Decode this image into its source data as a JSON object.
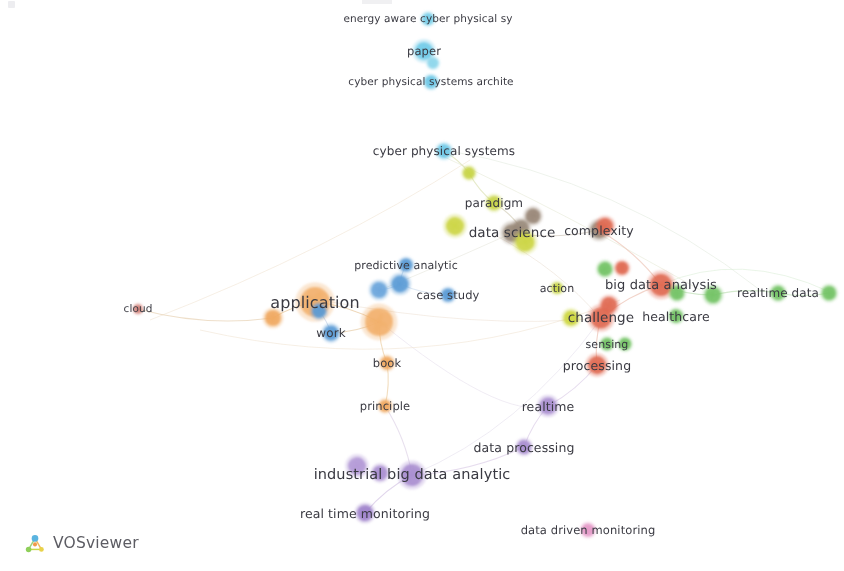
{
  "app": {
    "name": "VOSviewer",
    "logo_text": "VOSviewer",
    "logo_icon": "vosviewer-network-logo",
    "background_color": "#ffffff",
    "label_color": "#3a3a42",
    "canvas_width": 844,
    "canvas_height": 571
  },
  "chart_data": {
    "type": "scatter",
    "title": "",
    "subtitle": "",
    "xlabel": "",
    "ylabel": "",
    "grid": false,
    "legend_position": "none",
    "clusters": [
      {
        "id": 1,
        "name": "cyber-physical-systems",
        "color": "#6fc9e8"
      },
      {
        "id": 2,
        "name": "analytics-methods",
        "color": "#5b9bd5"
      },
      {
        "id": 3,
        "name": "application-work",
        "color": "#f0a860"
      },
      {
        "id": 4,
        "name": "data-science",
        "color": "#cdd63f"
      },
      {
        "id": 5,
        "name": "paradigm-complexity",
        "color": "#9c8878"
      },
      {
        "id": 6,
        "name": "big-data-challenge",
        "color": "#e06a52"
      },
      {
        "id": 7,
        "name": "healthcare-realtime",
        "color": "#74c365"
      },
      {
        "id": 8,
        "name": "industrial-monitoring",
        "color": "#a98fd0"
      },
      {
        "id": 9,
        "name": "data-driven-monitoring",
        "color": "#e59ac8"
      }
    ],
    "nodes": [
      {
        "label": "energy aware cyber physical sy",
        "x": 428,
        "y": 19,
        "r": 6,
        "color": "#79cfe9",
        "font": 10.5,
        "label_dx": 0,
        "label_dy": 0,
        "show_label": true
      },
      {
        "label": "paper",
        "x": 424,
        "y": 51,
        "r": 9,
        "color": "#72cbe8",
        "font": 11.5,
        "label_dx": 0,
        "label_dy": 0,
        "show_label": true
      },
      {
        "label": "",
        "x": 433,
        "y": 63,
        "r": 5.5,
        "color": "#8ed6ec",
        "font": 10,
        "label_dx": 0,
        "label_dy": 0,
        "show_label": false
      },
      {
        "label": "cyber physical systems archite",
        "x": 431,
        "y": 82,
        "r": 6.5,
        "color": "#6ec8e6",
        "font": 10.5,
        "label_dx": 0,
        "label_dy": 0,
        "show_label": true
      },
      {
        "label": "cyber physical systems",
        "x": 444,
        "y": 151,
        "r": 7,
        "color": "#6ec8e6",
        "font": 12,
        "label_dx": 0,
        "label_dy": 0,
        "show_label": true
      },
      {
        "label": "",
        "x": 469,
        "y": 173,
        "r": 6,
        "color": "#c8d448",
        "font": 10,
        "label_dx": 0,
        "label_dy": 0,
        "show_label": false
      },
      {
        "label": "paradigm",
        "x": 494,
        "y": 203,
        "r": 7,
        "color": "#c8d448",
        "font": 12,
        "label_dx": 0,
        "label_dy": 0,
        "show_label": true
      },
      {
        "label": "",
        "x": 533,
        "y": 216,
        "r": 7.5,
        "color": "#9a8878",
        "font": 10,
        "label_dx": 0,
        "label_dy": 0,
        "show_label": false
      },
      {
        "label": "",
        "x": 521,
        "y": 228,
        "r": 8,
        "color": "#9a8a7a",
        "font": 10,
        "label_dx": 0,
        "label_dy": 0,
        "show_label": false
      },
      {
        "label": "data science",
        "x": 512,
        "y": 233,
        "r": 9,
        "color": "#9a8a7a",
        "font": 13.5,
        "label_dx": 0,
        "label_dy": 0,
        "show_label": true
      },
      {
        "label": "",
        "x": 455,
        "y": 226,
        "r": 9,
        "color": "#ccd545",
        "font": 10,
        "label_dx": 0,
        "label_dy": 0,
        "show_label": false
      },
      {
        "label": "",
        "x": 525,
        "y": 242,
        "r": 9.5,
        "color": "#ccd545",
        "font": 10,
        "label_dx": 0,
        "label_dy": 0,
        "show_label": false
      },
      {
        "label": "complexity",
        "x": 599,
        "y": 230,
        "r": 8.5,
        "color": "#9a8a7a",
        "font": 12.5,
        "label_dx": 0,
        "label_dy": 0,
        "show_label": true
      },
      {
        "label": "",
        "x": 605,
        "y": 226,
        "r": 8,
        "color": "#e06a52",
        "font": 10,
        "label_dx": 0,
        "label_dy": 0,
        "show_label": false
      },
      {
        "label": "predictive analytic",
        "x": 406,
        "y": 265,
        "r": 6.5,
        "color": "#5b9bd5",
        "font": 11,
        "label_dx": 0,
        "label_dy": 0,
        "show_label": true
      },
      {
        "label": "",
        "x": 379,
        "y": 290,
        "r": 8,
        "color": "#6aa5db",
        "font": 10,
        "label_dx": 0,
        "label_dy": 0,
        "show_label": false
      },
      {
        "label": "",
        "x": 400,
        "y": 284,
        "r": 8.5,
        "color": "#5b9bd5",
        "font": 10,
        "label_dx": 0,
        "label_dy": 0,
        "show_label": false
      },
      {
        "label": "case study",
        "x": 448,
        "y": 295,
        "r": 6.5,
        "color": "#5b9bd5",
        "font": 11.5,
        "label_dx": 0,
        "label_dy": 0,
        "show_label": true
      },
      {
        "label": "application",
        "x": 315,
        "y": 302,
        "r": 15,
        "color": "#f2b06b",
        "font": 16,
        "label_dx": 0,
        "label_dy": 0,
        "show_label": true
      },
      {
        "label": "cloud",
        "x": 138,
        "y": 309,
        "r": 4.5,
        "color": "#d4867e",
        "font": 10.5,
        "label_dx": 0,
        "label_dy": 0,
        "show_label": true
      },
      {
        "label": "",
        "x": 273,
        "y": 318,
        "r": 8,
        "color": "#f0a860",
        "font": 10,
        "label_dx": 0,
        "label_dy": 0,
        "show_label": false
      },
      {
        "label": "",
        "x": 319,
        "y": 311,
        "r": 7,
        "color": "#5b9bd5",
        "font": 10,
        "label_dx": 0,
        "label_dy": 0,
        "show_label": false
      },
      {
        "label": "work",
        "x": 331,
        "y": 333,
        "r": 7.5,
        "color": "#5b9bd5",
        "font": 12,
        "label_dx": 0,
        "label_dy": 0,
        "show_label": true
      },
      {
        "label": "",
        "x": 379,
        "y": 322,
        "r": 14,
        "color": "#f2b06b",
        "font": 10,
        "label_dx": 0,
        "label_dy": 0,
        "show_label": false
      },
      {
        "label": "book",
        "x": 387,
        "y": 363,
        "r": 6.5,
        "color": "#f0a860",
        "font": 11.5,
        "label_dx": 0,
        "label_dy": 0,
        "show_label": true
      },
      {
        "label": "principle",
        "x": 385,
        "y": 406,
        "r": 6,
        "color": "#f0a860",
        "font": 11.5,
        "label_dx": 0,
        "label_dy": 0,
        "show_label": true
      },
      {
        "label": "action",
        "x": 557,
        "y": 288,
        "r": 5.5,
        "color": "#c8d448",
        "font": 11,
        "label_dx": 0,
        "label_dy": 0,
        "show_label": true
      },
      {
        "label": "",
        "x": 605,
        "y": 269,
        "r": 7,
        "color": "#74c365",
        "font": 10,
        "label_dx": 0,
        "label_dy": 0,
        "show_label": false
      },
      {
        "label": "",
        "x": 622,
        "y": 268,
        "r": 6.5,
        "color": "#e06a52",
        "font": 10,
        "label_dx": 0,
        "label_dy": 0,
        "show_label": false
      },
      {
        "label": "big data analysis",
        "x": 661,
        "y": 285,
        "r": 11,
        "color": "#e06a52",
        "font": 13,
        "label_dx": 0,
        "label_dy": 0,
        "show_label": true
      },
      {
        "label": "",
        "x": 677,
        "y": 293,
        "r": 7,
        "color": "#74c365",
        "font": 10,
        "label_dx": 0,
        "label_dy": 0,
        "show_label": false
      },
      {
        "label": "",
        "x": 713,
        "y": 295,
        "r": 8,
        "color": "#74c365",
        "font": 10,
        "label_dx": 0,
        "label_dy": 0,
        "show_label": false
      },
      {
        "label": "realtime data",
        "x": 778,
        "y": 293,
        "r": 7,
        "color": "#74c365",
        "font": 12,
        "label_dx": 0,
        "label_dy": 0,
        "show_label": true
      },
      {
        "label": "",
        "x": 829,
        "y": 293,
        "r": 7,
        "color": "#74c365",
        "font": 10,
        "label_dx": 0,
        "label_dy": 0,
        "show_label": false
      },
      {
        "label": "",
        "x": 609,
        "y": 305,
        "r": 8,
        "color": "#e06a52",
        "font": 10,
        "label_dx": 0,
        "label_dy": 0,
        "show_label": false
      },
      {
        "label": "challenge",
        "x": 601,
        "y": 318,
        "r": 10.5,
        "color": "#e06a52",
        "font": 13.5,
        "label_dx": 0,
        "label_dy": 0,
        "show_label": true
      },
      {
        "label": "",
        "x": 571,
        "y": 318,
        "r": 7.5,
        "color": "#cdd63f",
        "font": 10,
        "label_dx": 0,
        "label_dy": 0,
        "show_label": false
      },
      {
        "label": "healthcare",
        "x": 676,
        "y": 316,
        "r": 6.5,
        "color": "#74c365",
        "font": 12.5,
        "label_dx": 0,
        "label_dy": 0,
        "show_label": true
      },
      {
        "label": "sensing",
        "x": 607,
        "y": 344,
        "r": 6,
        "color": "#74c365",
        "font": 11,
        "label_dx": 0,
        "label_dy": 0,
        "show_label": true
      },
      {
        "label": "",
        "x": 625,
        "y": 344,
        "r": 6,
        "color": "#74c365",
        "font": 10,
        "label_dx": 0,
        "label_dy": 0,
        "show_label": false
      },
      {
        "label": "processing",
        "x": 597,
        "y": 365,
        "r": 9,
        "color": "#e06a52",
        "font": 12.5,
        "label_dx": 0,
        "label_dy": 0,
        "show_label": true
      },
      {
        "label": "realtime",
        "x": 548,
        "y": 406,
        "r": 8.5,
        "color": "#a98fd0",
        "font": 12.5,
        "label_dx": 0,
        "label_dy": 0,
        "show_label": true
      },
      {
        "label": "data processing",
        "x": 524,
        "y": 447,
        "r": 7,
        "color": "#a98fd0",
        "font": 12.5,
        "label_dx": 0,
        "label_dy": 0,
        "show_label": true
      },
      {
        "label": "",
        "x": 357,
        "y": 466,
        "r": 9,
        "color": "#b39ad6",
        "font": 10,
        "label_dx": 0,
        "label_dy": 0,
        "show_label": false
      },
      {
        "label": "",
        "x": 380,
        "y": 473,
        "r": 7.5,
        "color": "#a98fd0",
        "font": 10,
        "label_dx": 0,
        "label_dy": 0,
        "show_label": false
      },
      {
        "label": "industrial big data analytic",
        "x": 412,
        "y": 475,
        "r": 11,
        "color": "#a98fd0",
        "font": 14.5,
        "label_dx": 0,
        "label_dy": 0,
        "show_label": true
      },
      {
        "label": "real time monitoring",
        "x": 365,
        "y": 513,
        "r": 8,
        "color": "#9f83cb",
        "font": 12.5,
        "label_dx": 0,
        "label_dy": 0,
        "show_label": true
      },
      {
        "label": "data driven monitoring",
        "x": 588,
        "y": 530,
        "r": 6.5,
        "color": "#e59ac8",
        "font": 11.5,
        "label_dx": 0,
        "label_dy": 0,
        "show_label": true
      }
    ],
    "edges": [
      {
        "from": 138,
        "fy": 309,
        "to": 273,
        "ty": 318,
        "color": "#e8d4b8"
      },
      {
        "from": 273,
        "fy": 318,
        "to": 315,
        "ty": 302,
        "color": "#e8c9a0"
      },
      {
        "from": 315,
        "fy": 302,
        "to": 319,
        "ty": 311,
        "color": "#dfc8a8"
      },
      {
        "from": 319,
        "fy": 311,
        "to": 331,
        "ty": 333,
        "color": "#c9d6e8"
      },
      {
        "from": 331,
        "fy": 333,
        "to": 379,
        "ty": 322,
        "color": "#e8d0ad"
      },
      {
        "from": 315,
        "fy": 302,
        "to": 379,
        "ty": 322,
        "color": "#e8c9a0"
      },
      {
        "from": 379,
        "fy": 322,
        "to": 387,
        "ty": 363,
        "color": "#eed3ab"
      },
      {
        "from": 387,
        "fy": 363,
        "to": 385,
        "ty": 406,
        "color": "#eed3ab"
      },
      {
        "from": 379,
        "fy": 290,
        "to": 400,
        "ty": 284,
        "color": "#c9dcee"
      },
      {
        "from": 400,
        "fy": 284,
        "to": 406,
        "ty": 265,
        "color": "#c9dcee"
      },
      {
        "from": 400,
        "fy": 284,
        "to": 448,
        "ty": 295,
        "color": "#d4e2f0"
      },
      {
        "from": 444,
        "fy": 151,
        "to": 469,
        "ty": 173,
        "color": "#dde3b8"
      },
      {
        "from": 469,
        "fy": 173,
        "to": 494,
        "ty": 203,
        "color": "#dde3b8"
      },
      {
        "from": 494,
        "fy": 203,
        "to": 521,
        "ty": 228,
        "color": "#d6d2bd"
      },
      {
        "from": 512,
        "fy": 233,
        "to": 599,
        "ty": 230,
        "color": "#d4cbc0"
      },
      {
        "from": 599,
        "fy": 230,
        "to": 661,
        "ty": 285,
        "color": "#edc8bb"
      },
      {
        "from": 661,
        "fy": 285,
        "to": 713,
        "ty": 295,
        "color": "#c6e3bd"
      },
      {
        "from": 713,
        "fy": 295,
        "to": 778,
        "ty": 293,
        "color": "#c6e3bd"
      },
      {
        "from": 778,
        "fy": 293,
        "to": 829,
        "ty": 293,
        "color": "#c6e3bd"
      },
      {
        "from": 601,
        "fy": 318,
        "to": 661,
        "ty": 285,
        "color": "#eec6b8"
      },
      {
        "from": 601,
        "fy": 318,
        "to": 597,
        "ty": 365,
        "color": "#eec6b8"
      },
      {
        "from": 597,
        "fy": 365,
        "to": 548,
        "ty": 406,
        "color": "#ddd0e8"
      },
      {
        "from": 548,
        "fy": 406,
        "to": 524,
        "ty": 447,
        "color": "#ddd0e8"
      },
      {
        "from": 524,
        "fy": 447,
        "to": 412,
        "ty": 475,
        "color": "#ddd0e8"
      },
      {
        "from": 412,
        "fy": 475,
        "to": 365,
        "ty": 513,
        "color": "#d7c8e6"
      },
      {
        "from": 385,
        "fy": 406,
        "to": 412,
        "ty": 475,
        "color": "#e0d6e8"
      }
    ]
  }
}
